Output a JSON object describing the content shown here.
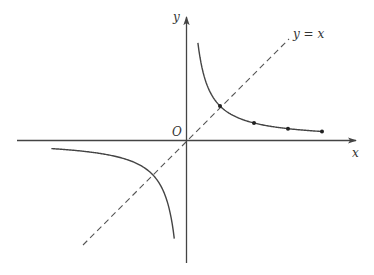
{
  "figure": {
    "type": "function-graph",
    "function": "y = k/x (reciprocal / hyperbola), k = 1",
    "colors": {
      "axes": "#444444",
      "curve": "#444444",
      "dashed_line": "#555555",
      "points": "#222222"
    }
  },
  "labels": {
    "x_axis": "x",
    "y_axis": "y",
    "origin": "O",
    "line": "y = x"
  },
  "geometry": {
    "origin_px": [
      186,
      140
    ],
    "unit_px": 34,
    "x_axis_range": [
      -5,
      5
    ],
    "y_axis_range": [
      -3.6,
      3.6
    ]
  },
  "chart_data": {
    "type": "line",
    "title": "",
    "xlabel": "x",
    "ylabel": "y",
    "series": [
      {
        "name": "y = 1/x (x > 0)",
        "style": "solid",
        "x": [
          0.35,
          0.5,
          0.75,
          1,
          1.5,
          2,
          3,
          4
        ],
        "y": [
          2.86,
          2,
          1.33,
          1,
          0.67,
          0.5,
          0.33,
          0.25
        ]
      },
      {
        "name": "y = 1/x (x < 0)",
        "style": "solid",
        "x": [
          -4,
          -3,
          -2,
          -1,
          -0.75,
          -0.5,
          -0.33
        ],
        "y": [
          -0.25,
          -0.33,
          -0.5,
          -1,
          -1.33,
          -2,
          -3
        ]
      },
      {
        "name": "y = x",
        "style": "dashed",
        "x": [
          -3,
          3
        ],
        "y": [
          -3,
          3
        ]
      }
    ],
    "marked_points": [
      {
        "x": 1,
        "y": 1
      },
      {
        "x": 2,
        "y": 0.5
      },
      {
        "x": 3,
        "y": 0.333
      },
      {
        "x": 4,
        "y": 0.25
      }
    ],
    "intersections": [
      {
        "x": 1,
        "y": 1
      },
      {
        "x": -1,
        "y": -1
      }
    ],
    "grid": false,
    "legend": "none"
  }
}
